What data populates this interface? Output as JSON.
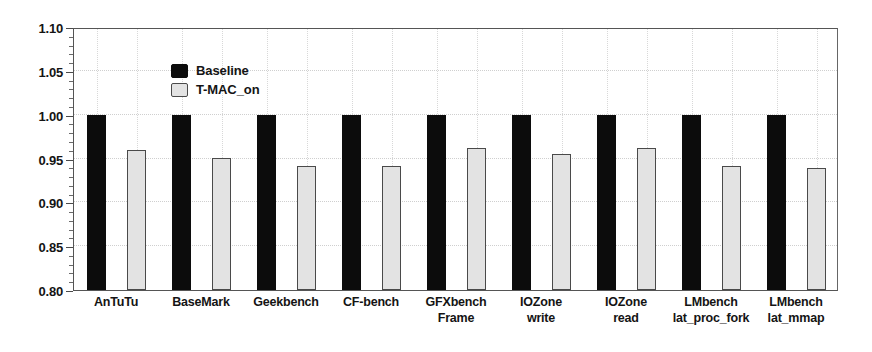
{
  "chart_data": {
    "type": "bar",
    "title": "",
    "xlabel": "",
    "ylabel": "",
    "ylim": [
      0.8,
      1.1
    ],
    "ytick_step": 0.05,
    "yticks": [
      "0.80",
      "0.85",
      "0.90",
      "0.95",
      "1.00",
      "1.05",
      "1.10"
    ],
    "ytick_values": [
      0.8,
      0.85,
      0.9,
      0.95,
      1.0,
      1.05,
      1.1
    ],
    "minor_ticks_per_interval": 5,
    "grid": "dotted-light",
    "legend_position": "top-left-inside",
    "categories": [
      "AnTuTu",
      "BaseMark",
      "Geekbench",
      "CF-bench",
      "GFXbench Frame",
      "IOZone write",
      "IOZone read",
      "LMbench lat_proc_fork",
      "LMbench lat_mmap"
    ],
    "category_lines": [
      [
        "AnTuTu",
        ""
      ],
      [
        "BaseMark",
        ""
      ],
      [
        "Geekbench",
        ""
      ],
      [
        "CF-bench",
        ""
      ],
      [
        "GFXbench",
        "Frame"
      ],
      [
        "IOZone",
        "write"
      ],
      [
        "IOZone",
        "read"
      ],
      [
        "LMbench",
        "lat_proc_fork"
      ],
      [
        "LMbench",
        "lat_mmap"
      ]
    ],
    "series": [
      {
        "name": "Baseline",
        "color": "#0c0c0c",
        "values": [
          1.0,
          1.0,
          1.0,
          1.0,
          1.0,
          1.0,
          1.0,
          1.0,
          1.0
        ]
      },
      {
        "name": "T-MAC_on",
        "color": "#e3e3e3",
        "values": [
          0.96,
          0.951,
          0.941,
          0.941,
          0.962,
          0.955,
          0.962,
          0.942,
          0.939
        ]
      }
    ]
  },
  "legend": {
    "items": [
      {
        "label": "Baseline"
      },
      {
        "label": "T-MAC_on"
      }
    ]
  },
  "colors": {
    "baseline": "#0c0c0c",
    "tmac": "#e3e3e3",
    "axis": "#4a4a4a",
    "grid": "#cfcfcf",
    "background": "#ffffff"
  }
}
